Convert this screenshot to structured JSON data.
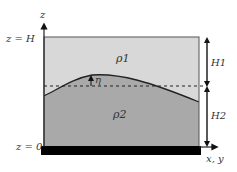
{
  "diagram": {
    "axis_z_label": "z",
    "axis_xy_label": "x, y",
    "top_label": "z = H",
    "bottom_label": "z = 0",
    "upper_layer": {
      "density_label": "ρ1",
      "thickness_label": "H1",
      "color": "#d8d8d8"
    },
    "lower_layer": {
      "density_label": "ρ2",
      "thickness_label": "H2",
      "color": "#a9a9a9"
    },
    "displacement_label": "η",
    "bottom_boundary_color": "#000000"
  }
}
